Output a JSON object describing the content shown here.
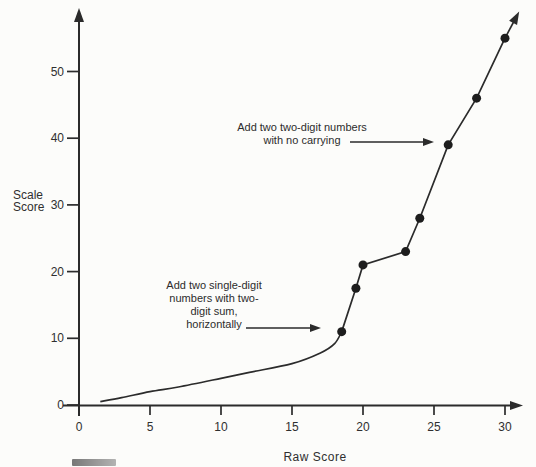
{
  "figure": {
    "background": "#fcfcfa",
    "ink": "#2b2b2b"
  },
  "chart_data": {
    "type": "line",
    "title": "",
    "xlabel": "Raw Score",
    "ylabel": "Scale Score",
    "ylabel_lines": [
      "Scale",
      "Score"
    ],
    "xlim": [
      0,
      31.5
    ],
    "ylim": [
      0,
      60
    ],
    "x_ticks": [
      0,
      5,
      10,
      15,
      20,
      25,
      30
    ],
    "y_ticks": [
      0,
      10,
      20,
      30,
      40,
      50
    ],
    "grid": false,
    "legend": "none",
    "axis_arrows": true,
    "series": [
      {
        "name": "smooth-lower-segment",
        "marker": "none",
        "points": [
          [
            1.5,
            0.5
          ],
          [
            3,
            1.1
          ],
          [
            5,
            2
          ],
          [
            7,
            2.7
          ],
          [
            10,
            4
          ],
          [
            12,
            4.9
          ],
          [
            15,
            6.2
          ],
          [
            17,
            7.8
          ],
          [
            18,
            9.2
          ],
          [
            18.5,
            11
          ]
        ]
      },
      {
        "name": "marked-upper-segment",
        "marker": "filled-circle",
        "points": [
          [
            18.5,
            11
          ],
          [
            19.5,
            17.5
          ],
          [
            20,
            21
          ],
          [
            23,
            23
          ],
          [
            24,
            28
          ],
          [
            26,
            39
          ],
          [
            28,
            46
          ],
          [
            30,
            55
          ]
        ],
        "arrow_end": [
          31,
          59
        ]
      }
    ],
    "annotations": [
      {
        "lines": [
          "Add two two-digit numbers",
          "with no carrying"
        ],
        "target_point": [
          26,
          39
        ],
        "arrow": {
          "x1": 350,
          "y1": 142,
          "x2": 434,
          "y2": 142
        }
      },
      {
        "lines": [
          "Add two single-digit",
          "numbers with two-",
          "digit sum,",
          "horizontally"
        ],
        "target_point": [
          18.5,
          11
        ],
        "arrow": {
          "x1": 246,
          "y1": 328,
          "x2": 321,
          "y2": 328
        }
      }
    ]
  }
}
